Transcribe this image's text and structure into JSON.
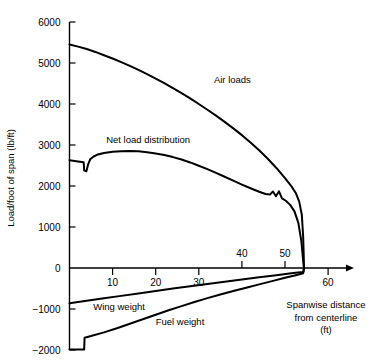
{
  "chart_data": {
    "type": "line",
    "title": "",
    "subtitle": "",
    "xlabel": "Spanwise distance from centerline (ft)",
    "xlabel_lines": [
      "Spanwise distance",
      "from centerline",
      "(ft)"
    ],
    "ylabel": "Load/foot of span (lb/ft)",
    "xlim": [
      0,
      66
    ],
    "ylim": [
      -2000,
      6000
    ],
    "grid": false,
    "legend_position": "inline-annotations",
    "x_ticks": [
      {
        "value": 10,
        "label": "10",
        "side": "below"
      },
      {
        "value": 20,
        "label": "20",
        "side": "below"
      },
      {
        "value": 30,
        "label": "30",
        "side": "below"
      },
      {
        "value": 40,
        "label": "40",
        "side": "above"
      },
      {
        "value": 50,
        "label": "50",
        "side": "above"
      },
      {
        "value": 60,
        "label": "60",
        "side": "below"
      }
    ],
    "y_ticks": [
      {
        "value": 6000,
        "label": "6000"
      },
      {
        "value": 5000,
        "label": "5000"
      },
      {
        "value": 4000,
        "label": "4000"
      },
      {
        "value": 3000,
        "label": "3000"
      },
      {
        "value": 2000,
        "label": "2000"
      },
      {
        "value": 1000,
        "label": "1000"
      },
      {
        "value": 0,
        "label": "0"
      },
      {
        "value": -1000,
        "label": "-1000"
      },
      {
        "value": -2000,
        "label": "-2000"
      }
    ],
    "annotations": [
      {
        "name": "air-loads",
        "text": "Air loads",
        "x": 33.5,
        "y": 4520
      },
      {
        "name": "net-load-distribution",
        "text": "Net load distribution",
        "x": 8.5,
        "y": 3060
      },
      {
        "name": "wing-weight",
        "text": "Wing weight",
        "x": 5.5,
        "y": -1020
      },
      {
        "name": "fuel-weight",
        "text": "Fuel weight",
        "x": 20.0,
        "y": -1380
      }
    ],
    "series": [
      {
        "name": "Air loads",
        "points": [
          [
            0,
            5450
          ],
          [
            2,
            5400
          ],
          [
            4,
            5340
          ],
          [
            6,
            5270
          ],
          [
            8,
            5190
          ],
          [
            10,
            5110
          ],
          [
            12,
            5020
          ],
          [
            14,
            4930
          ],
          [
            16,
            4830
          ],
          [
            18,
            4730
          ],
          [
            20,
            4620
          ],
          [
            22,
            4510
          ],
          [
            24,
            4390
          ],
          [
            26,
            4265
          ],
          [
            28,
            4135
          ],
          [
            30,
            4000
          ],
          [
            32,
            3860
          ],
          [
            34,
            3715
          ],
          [
            36,
            3565
          ],
          [
            38,
            3405
          ],
          [
            40,
            3240
          ],
          [
            42,
            3060
          ],
          [
            44,
            2870
          ],
          [
            46,
            2665
          ],
          [
            48,
            2440
          ],
          [
            50,
            2190
          ],
          [
            51.5,
            1990
          ],
          [
            52.5,
            1830
          ],
          [
            53.3,
            1620
          ],
          [
            53.9,
            1300
          ],
          [
            54.2,
            800
          ],
          [
            54.35,
            300
          ],
          [
            54.4,
            0
          ]
        ]
      },
      {
        "name": "Net load distribution",
        "points": [
          [
            0,
            2630
          ],
          [
            2.0,
            2600
          ],
          [
            3.3,
            2580
          ],
          [
            3.4,
            2380
          ],
          [
            3.9,
            2355
          ],
          [
            4.3,
            2520
          ],
          [
            4.8,
            2650
          ],
          [
            5.6,
            2720
          ],
          [
            6.6,
            2770
          ],
          [
            8,
            2805
          ],
          [
            10,
            2835
          ],
          [
            12,
            2850
          ],
          [
            14,
            2855
          ],
          [
            16,
            2845
          ],
          [
            18,
            2825
          ],
          [
            20,
            2795
          ],
          [
            22,
            2755
          ],
          [
            24,
            2705
          ],
          [
            26,
            2645
          ],
          [
            28,
            2575
          ],
          [
            30,
            2495
          ],
          [
            32,
            2410
          ],
          [
            34,
            2320
          ],
          [
            36,
            2225
          ],
          [
            38,
            2130
          ],
          [
            40,
            2035
          ],
          [
            42,
            1945
          ],
          [
            44,
            1860
          ],
          [
            45.5,
            1805
          ],
          [
            46.5,
            1790
          ],
          [
            47.2,
            1865
          ],
          [
            47.9,
            1750
          ],
          [
            48.6,
            1870
          ],
          [
            49.3,
            1700
          ],
          [
            50.2,
            1640
          ],
          [
            51.2,
            1540
          ],
          [
            52.2,
            1380
          ],
          [
            53.1,
            1100
          ],
          [
            53.8,
            650
          ],
          [
            54.2,
            200
          ],
          [
            54.4,
            0
          ]
        ]
      },
      {
        "name": "Wing weight",
        "points": [
          [
            0,
            -860
          ],
          [
            4,
            -800
          ],
          [
            8,
            -740
          ],
          [
            12,
            -680
          ],
          [
            16,
            -620
          ],
          [
            20,
            -560
          ],
          [
            24,
            -500
          ],
          [
            28,
            -445
          ],
          [
            32,
            -390
          ],
          [
            36,
            -335
          ],
          [
            40,
            -280
          ],
          [
            44,
            -225
          ],
          [
            48,
            -175
          ],
          [
            51,
            -135
          ],
          [
            53,
            -110
          ],
          [
            54.3,
            -95
          ],
          [
            54.4,
            0
          ]
        ]
      },
      {
        "name": "Fuel weight",
        "points": [
          [
            0,
            -1990
          ],
          [
            3.4,
            -1990
          ],
          [
            3.5,
            -1700
          ],
          [
            5,
            -1660
          ],
          [
            8,
            -1570
          ],
          [
            11,
            -1470
          ],
          [
            14,
            -1360
          ],
          [
            17,
            -1250
          ],
          [
            20,
            -1140
          ],
          [
            23,
            -1030
          ],
          [
            26,
            -930
          ],
          [
            29,
            -830
          ],
          [
            32,
            -735
          ],
          [
            35,
            -645
          ],
          [
            38,
            -560
          ],
          [
            41,
            -480
          ],
          [
            44,
            -400
          ],
          [
            47,
            -320
          ],
          [
            50,
            -240
          ],
          [
            52.5,
            -175
          ],
          [
            54.2,
            -130
          ],
          [
            54.4,
            0
          ]
        ]
      }
    ]
  },
  "axis": {
    "x_arrow": "right-arrow",
    "origin_label": "0"
  }
}
